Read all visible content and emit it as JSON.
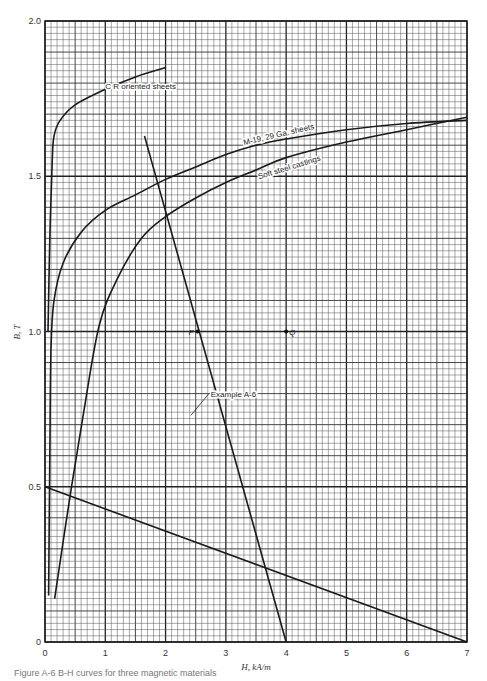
{
  "caption": "Figure A-6  B-H curves for three magnetic materials",
  "chart_data": {
    "type": "line",
    "title": "",
    "xlabel": "H, kA/m",
    "ylabel": "B, T",
    "xlim": [
      0,
      7
    ],
    "ylim": [
      0,
      2.0
    ],
    "xticks": [
      0,
      1,
      2,
      3,
      4,
      5,
      6,
      7
    ],
    "yticks": [
      0,
      0.5,
      1.0,
      1.5,
      2.0
    ],
    "ytick_labels": [
      "0",
      "0.5",
      "1.0",
      "1.5",
      "2.0"
    ],
    "grid": true,
    "grid_minor_step_x": 0.1,
    "grid_minor_step_y": 0.02,
    "series": [
      {
        "name": "C R oriented sheets",
        "label_pos": [
          1.0,
          1.78
        ],
        "label_angle": 0,
        "points": [
          [
            0.05,
            1.0
          ],
          [
            0.08,
            1.3
          ],
          [
            0.12,
            1.55
          ],
          [
            0.15,
            1.63
          ],
          [
            0.25,
            1.68
          ],
          [
            0.5,
            1.73
          ],
          [
            1.0,
            1.78
          ],
          [
            1.5,
            1.82
          ],
          [
            2.0,
            1.85
          ]
        ]
      },
      {
        "name": "M-19, 29 Ga. sheets",
        "label_pos": [
          3.3,
          1.6
        ],
        "label_angle": -13,
        "points": [
          [
            0.06,
            0.15
          ],
          [
            0.08,
            0.6
          ],
          [
            0.1,
            0.95
          ],
          [
            0.15,
            1.1
          ],
          [
            0.3,
            1.22
          ],
          [
            0.6,
            1.32
          ],
          [
            1.0,
            1.39
          ],
          [
            1.5,
            1.44
          ],
          [
            2.0,
            1.49
          ],
          [
            2.5,
            1.53
          ],
          [
            3.0,
            1.57
          ],
          [
            3.5,
            1.6
          ],
          [
            4.0,
            1.62
          ],
          [
            5.0,
            1.65
          ],
          [
            6.0,
            1.67
          ],
          [
            7.0,
            1.68
          ]
        ]
      },
      {
        "name": "Soft steel castings",
        "label_pos": [
          3.55,
          1.49
        ],
        "label_angle": -17,
        "points": [
          [
            0.16,
            0.14
          ],
          [
            0.4,
            0.45
          ],
          [
            0.65,
            0.75
          ],
          [
            0.9,
            1.02
          ],
          [
            1.2,
            1.17
          ],
          [
            1.6,
            1.3
          ],
          [
            2.0,
            1.37
          ],
          [
            2.5,
            1.43
          ],
          [
            3.0,
            1.48
          ],
          [
            3.5,
            1.52
          ],
          [
            4.0,
            1.56
          ],
          [
            5.0,
            1.61
          ],
          [
            6.0,
            1.65
          ],
          [
            7.0,
            1.69
          ]
        ]
      },
      {
        "name": "Example A-6",
        "label_pos": [
          2.75,
          0.79
        ],
        "label_angle": 0,
        "points": [
          [
            1.65,
            1.63
          ],
          [
            4.0,
            0.0
          ]
        ]
      },
      {
        "name": "Load line",
        "label_pos": null,
        "label_angle": 0,
        "points": [
          [
            0.0,
            0.5
          ],
          [
            7.0,
            0.0
          ]
        ]
      }
    ],
    "annotations": [
      {
        "text": "P",
        "x": 2.53,
        "y": 1.0
      },
      {
        "text": "Q",
        "x": 4.0,
        "y": 1.0
      }
    ]
  }
}
